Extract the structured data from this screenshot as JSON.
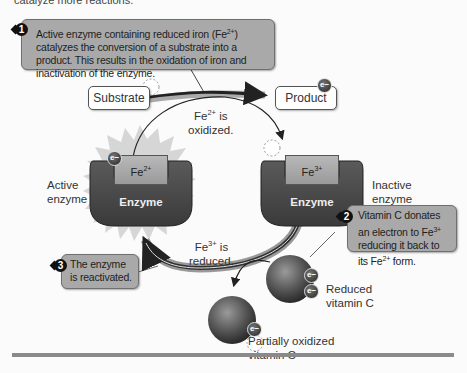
{
  "top_caption_fragment": "catalyze more reactions.",
  "callouts": [
    {
      "number": "1",
      "text_html": "Active enzyme containing reduced iron (Fe<sup>2+</sup>) catalyzes the conversion of a substrate into a product. This results in the oxidation of iron and inactivation of the enzyme."
    },
    {
      "number": "2",
      "text_html": "Vitamin C donates an electron to Fe<sup>3+</sup> reducing it back to its Fe<sup>2+</sup> form."
    },
    {
      "number": "3",
      "text_html": "The enzyme is reactivated."
    }
  ],
  "boxes": {
    "substrate": "Substrate",
    "product": "Product"
  },
  "labels": {
    "fe2_oxidized": "Fe<sup>2+</sup> is<br>oxidized.",
    "fe3_reduced": "Fe<sup>3+</sup> is<br>reduced.",
    "active_enzyme": "Active<br>enzyme",
    "inactive_enzyme": "Inactive<br>enzyme",
    "reduced_vitc": "Reduced<br>vitamin C",
    "partial_vitc": "Partially oxidized<br>vitamin C"
  },
  "enzymes": {
    "active": {
      "name": "Enzyme",
      "ion_html": "Fe<sup>2+</sup>"
    },
    "inactive": {
      "name": "Enzyme",
      "ion_html": "Fe<sup>3+</sup>"
    }
  },
  "electron_symbol": "e−",
  "colors": {
    "callout_bg": "#a9a9a9",
    "enzyme": "#4a4a4a",
    "background": "#fbfbfb"
  }
}
